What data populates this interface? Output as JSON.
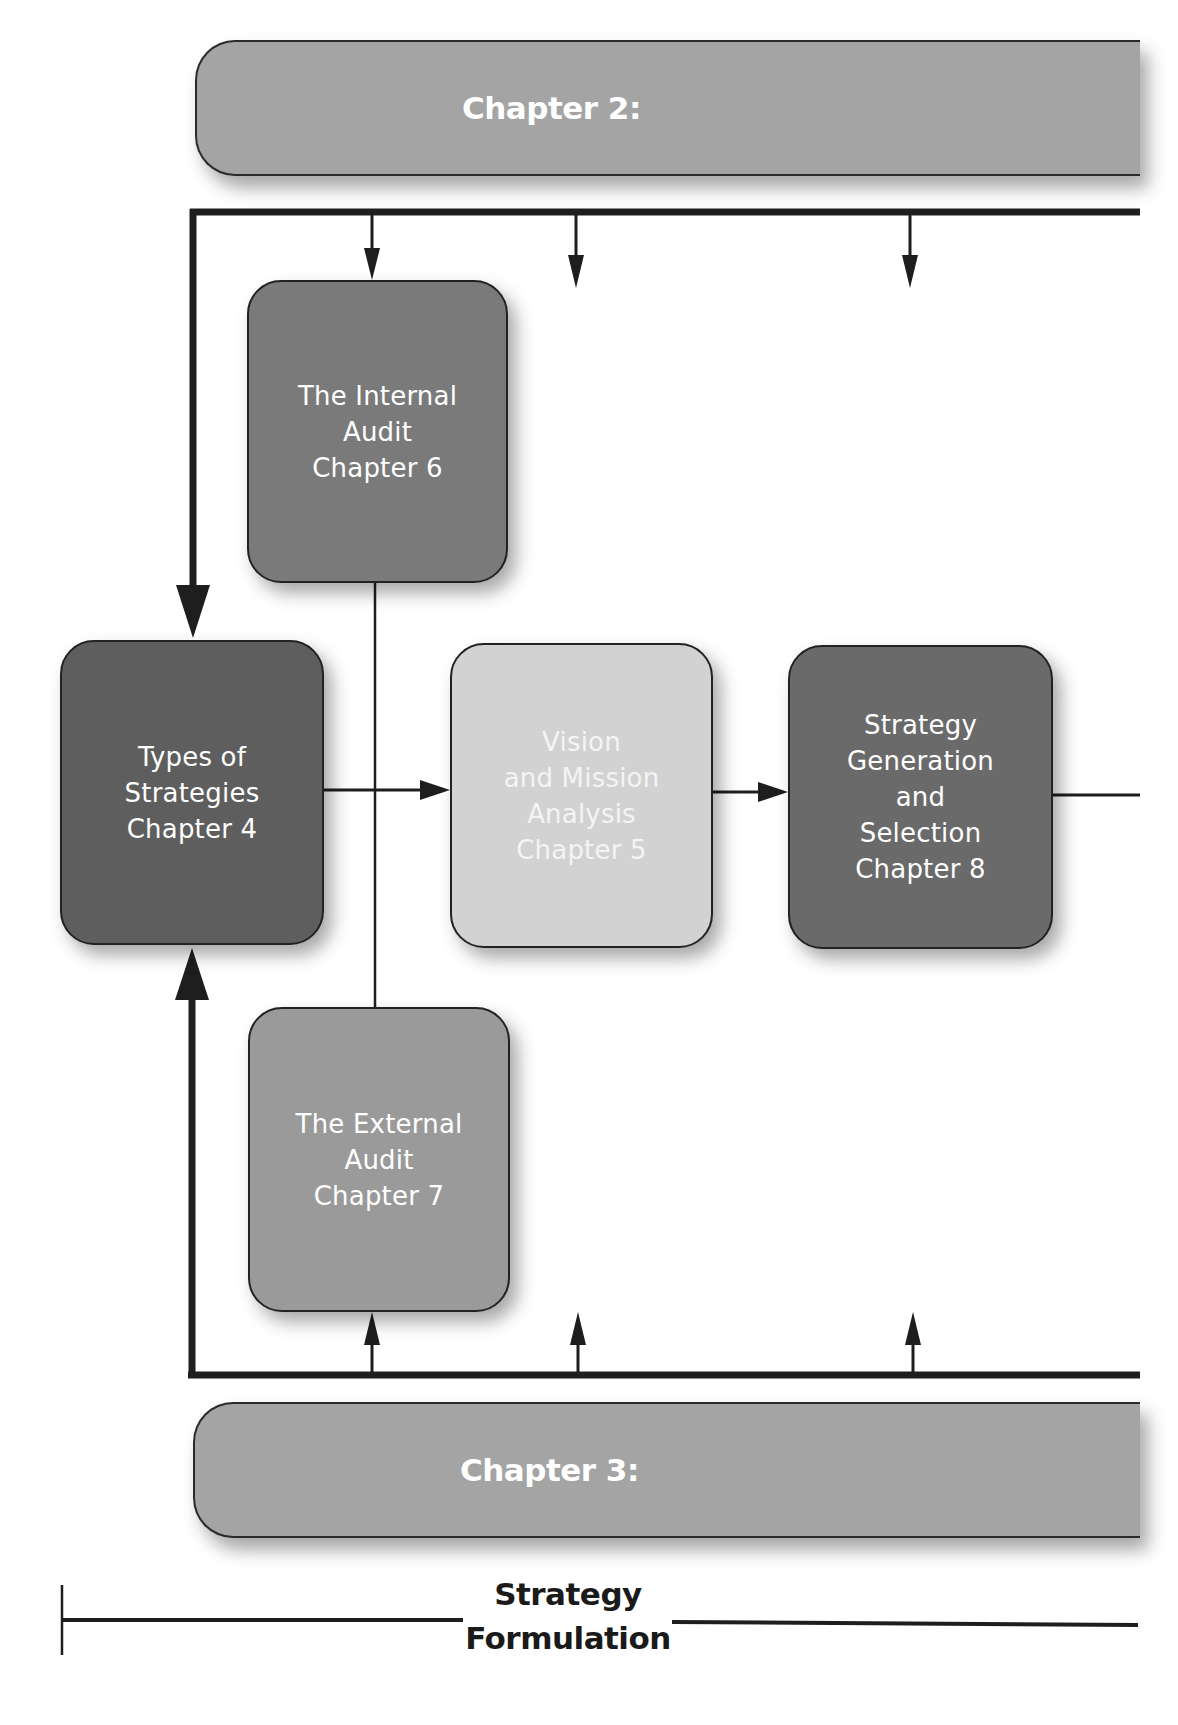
{
  "diagram": {
    "type": "flowchart",
    "colors": {
      "chapter_bar": "#a4a4a4",
      "internal_audit": "#7a7a7a",
      "types_of_strategies": "#5e5e5e",
      "vision_mission": "#d2d2d2",
      "strategy_generation": "#6a6a6a",
      "external_audit": "#9a9a9a",
      "lines": "#1e1e1e"
    },
    "top_bar": {
      "label": "Chapter 2:"
    },
    "bottom_bar": {
      "label": "Chapter 3:"
    },
    "boxes": {
      "internal_audit": {
        "lines": [
          "The Internal",
          "Audit",
          "Chapter 6"
        ]
      },
      "types_of_strategies": {
        "lines": [
          "Types of",
          "Strategies",
          "Chapter 4"
        ]
      },
      "vision_mission": {
        "lines": [
          "Vision",
          "and Mission",
          "Analysis",
          "Chapter 5"
        ]
      },
      "strategy_generation": {
        "lines": [
          "Strategy",
          "Generation",
          "and",
          "Selection",
          "Chapter 8"
        ]
      },
      "external_audit": {
        "lines": [
          "The External",
          "Audit",
          "Chapter 7"
        ]
      }
    },
    "footer": {
      "lines": [
        "Strategy",
        "Formulation"
      ]
    },
    "edges": [
      {
        "from": "top_bar",
        "to": "internal_audit"
      },
      {
        "from": "top_bar",
        "to": "types_of_strategies"
      },
      {
        "from": "bottom_bar",
        "to": "external_audit"
      },
      {
        "from": "bottom_bar",
        "to": "types_of_strategies"
      },
      {
        "from": "types_of_strategies",
        "to": "vision_mission"
      },
      {
        "from": "vision_mission",
        "to": "strategy_generation"
      },
      {
        "from": "internal_audit",
        "to": "external_audit",
        "style": "line"
      }
    ]
  }
}
